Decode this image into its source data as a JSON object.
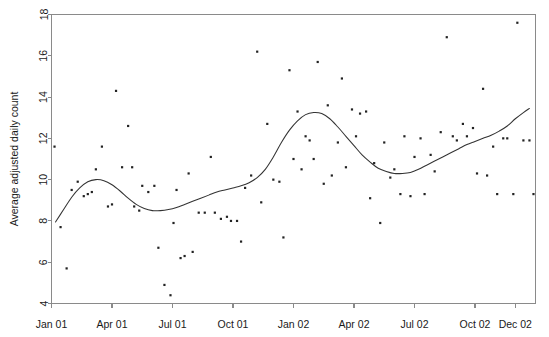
{
  "chart_data": {
    "type": "scatter",
    "title": "",
    "subtitle": "",
    "xlabel": "",
    "ylabel": "Average adjusted daily count",
    "ylim": [
      4,
      18
    ],
    "yticks": [
      4,
      6,
      8,
      10,
      12,
      14,
      16,
      18
    ],
    "ytick_labels": [
      "4",
      "6",
      "8",
      "10",
      "12",
      "14",
      "16",
      "18"
    ],
    "xlim": [
      0,
      24
    ],
    "xticks": [
      0,
      3,
      6,
      9,
      12,
      15,
      18,
      21,
      23
    ],
    "xtick_labels": [
      "Jan 01",
      "Apr 01",
      "Jul 01",
      "Oct 01",
      "Jan 02",
      "Apr 02",
      "Jul 02",
      "Oct 02",
      "Dec 02"
    ],
    "grid": false,
    "legend": null,
    "point_color": "#222222",
    "curve_color": "#333333",
    "axis_color": "#8a8a8a",
    "series": [
      {
        "name": "Average adjusted daily count",
        "type": "scatter",
        "x": [
          0.15,
          0.45,
          0.75,
          1.0,
          1.3,
          1.6,
          1.8,
          2.0,
          2.2,
          2.5,
          2.8,
          3.0,
          3.2,
          3.5,
          3.8,
          4.0,
          4.1,
          4.35,
          4.5,
          4.8,
          5.1,
          5.3,
          5.6,
          5.9,
          6.05,
          6.2,
          6.4,
          6.6,
          6.8,
          7.0,
          7.3,
          7.6,
          7.9,
          8.1,
          8.4,
          8.7,
          8.9,
          9.2,
          9.4,
          9.6,
          9.9,
          10.2,
          10.4,
          10.7,
          11.0,
          11.3,
          11.5,
          11.8,
          12.0,
          12.2,
          12.4,
          12.6,
          12.8,
          13.0,
          13.2,
          13.5,
          13.7,
          13.9,
          14.2,
          14.4,
          14.6,
          14.9,
          15.1,
          15.3,
          15.6,
          15.8,
          16.0,
          16.3,
          16.5,
          16.8,
          17.0,
          17.3,
          17.5,
          17.8,
          18.0,
          18.3,
          18.5,
          18.8,
          19.0,
          19.3,
          19.6,
          19.9,
          20.1,
          20.4,
          20.6,
          20.9,
          21.1,
          21.4,
          21.6,
          21.9,
          22.1,
          22.4,
          22.6,
          22.9,
          23.1,
          23.4,
          23.7,
          23.9
        ],
        "y": [
          11.6,
          7.7,
          5.7,
          9.5,
          9.9,
          9.2,
          9.3,
          9.4,
          10.5,
          11.6,
          8.7,
          8.8,
          14.3,
          10.6,
          12.6,
          10.6,
          8.7,
          8.5,
          9.7,
          9.4,
          9.7,
          6.7,
          4.9,
          4.4,
          7.9,
          9.5,
          6.2,
          6.3,
          10.3,
          6.5,
          8.4,
          8.4,
          11.1,
          8.4,
          8.1,
          8.2,
          8.0,
          8.0,
          7.0,
          9.6,
          10.2,
          16.2,
          8.9,
          12.7,
          10.0,
          9.9,
          7.2,
          15.3,
          11.0,
          13.3,
          10.5,
          12.1,
          11.9,
          11.0,
          15.7,
          9.8,
          13.6,
          10.2,
          11.8,
          14.9,
          10.6,
          13.4,
          12.1,
          13.2,
          13.3,
          9.1,
          10.8,
          7.9,
          11.8,
          10.1,
          10.5,
          9.3,
          12.1,
          9.2,
          11.1,
          12.0,
          9.3,
          11.2,
          10.4,
          12.3,
          16.9,
          12.1,
          11.9,
          12.7,
          12.1,
          12.5,
          10.3,
          14.4,
          10.2,
          11.6,
          9.3,
          12.0,
          12.0,
          9.3,
          17.6,
          11.9,
          11.9,
          9.3
        ]
      },
      {
        "name": "Smoothed trend",
        "type": "line",
        "x": [
          0.2,
          0.6,
          1.0,
          1.4,
          1.8,
          2.2,
          2.6,
          3.0,
          3.4,
          3.8,
          4.2,
          4.6,
          5.0,
          5.4,
          5.8,
          6.2,
          6.6,
          7.0,
          7.4,
          7.8,
          8.2,
          8.6,
          9.0,
          9.4,
          9.8,
          10.2,
          10.6,
          11.0,
          11.4,
          11.8,
          12.2,
          12.6,
          13.0,
          13.4,
          13.8,
          14.2,
          14.6,
          15.0,
          15.4,
          15.8,
          16.2,
          16.6,
          17.0,
          17.4,
          17.8,
          18.2,
          18.6,
          19.0,
          19.4,
          19.8,
          20.2,
          20.6,
          21.0,
          21.4,
          21.8,
          22.2,
          22.6,
          23.0,
          23.4,
          23.7
        ],
        "y": [
          7.95,
          8.55,
          9.15,
          9.6,
          9.9,
          10.0,
          9.95,
          9.75,
          9.45,
          9.1,
          8.8,
          8.6,
          8.5,
          8.5,
          8.55,
          8.65,
          8.8,
          8.95,
          9.1,
          9.25,
          9.4,
          9.5,
          9.6,
          9.7,
          9.85,
          10.1,
          10.5,
          11.1,
          11.8,
          12.4,
          12.85,
          13.15,
          13.25,
          13.2,
          12.95,
          12.55,
          12.1,
          11.65,
          11.2,
          10.85,
          10.55,
          10.4,
          10.3,
          10.3,
          10.35,
          10.5,
          10.7,
          10.9,
          11.1,
          11.3,
          11.5,
          11.7,
          11.85,
          12.0,
          12.15,
          12.35,
          12.6,
          12.95,
          13.25,
          13.45
        ]
      }
    ]
  }
}
